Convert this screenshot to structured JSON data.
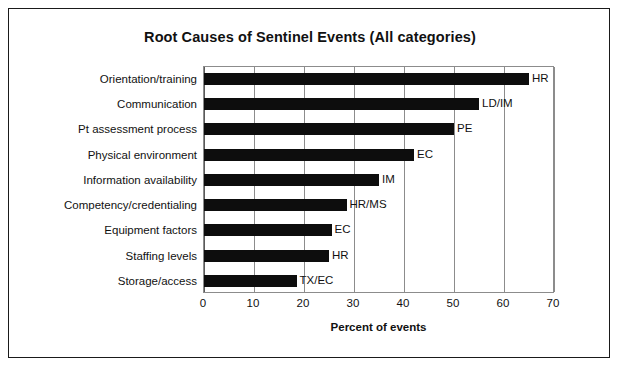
{
  "figure": {
    "title": "Root Causes of Sentinel Events (All categories)",
    "border_color": "#1a1a1a",
    "bar_color": "#0d0d0d",
    "grid_color": "#8c8c8c",
    "background": "#ffffff"
  },
  "chart_data": {
    "type": "bar",
    "orientation": "horizontal",
    "title": "Root Causes of Sentinel Events (All categories)",
    "xlabel": "Percent of events",
    "ylabel": "",
    "xlim": [
      0,
      70
    ],
    "xticks": [
      0,
      10,
      20,
      30,
      40,
      50,
      60,
      70
    ],
    "xtick_labels": [
      "0",
      "10",
      "20",
      "30",
      "40",
      "50",
      "60",
      "70"
    ],
    "grid": "vertical",
    "legend": "none",
    "categories": [
      "Orientation/training",
      "Communication",
      "Pt assessment process",
      "Physical environment",
      "Information availability",
      "Competency/credentialing",
      "Equipment factors",
      "Staffing levels",
      "Storage/access"
    ],
    "values": [
      65,
      55,
      50,
      42,
      35,
      28.5,
      25.5,
      25,
      18.5
    ],
    "annotations": [
      "HR",
      "LD/IM",
      "PE",
      "EC",
      "IM",
      "HR/MS",
      "EC",
      "HR",
      "TX/EC"
    ]
  }
}
